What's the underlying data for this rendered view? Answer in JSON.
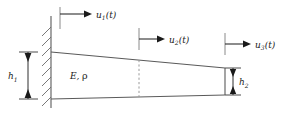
{
  "figure": {
    "type": "engineering-diagram",
    "background_color": "#ffffff",
    "line_color": "#5a5a5a",
    "dark_line_color": "#3c3c3c",
    "text_color": "#1a1a1a",
    "dashed_color": "#9a9a9a"
  },
  "labels": {
    "dof1": {
      "symbol": "u",
      "subscript": "1",
      "argument": "(t)",
      "full": "u1(t)"
    },
    "dof2": {
      "symbol": "u",
      "subscript": "2",
      "argument": "(t)",
      "full": "u2(t)"
    },
    "dof3": {
      "symbol": "u",
      "subscript": "3",
      "argument": "(t)",
      "full": "u3(t)"
    },
    "height_left": {
      "symbol": "h",
      "subscript": "1",
      "full": "h1"
    },
    "height_right": {
      "symbol": "h",
      "subscript": "2",
      "full": "h2"
    },
    "material": {
      "modulus": "E",
      "separator": ",",
      "density": "ρ",
      "full": "E, ρ"
    }
  },
  "elements": {
    "wall": "fixed-support-hatched-wall",
    "beam": "tapered-beam-outline",
    "node_line": "mid-node-dashed-line",
    "arrows": [
      "dof1-arrow",
      "dof2-arrow",
      "dof3-arrow"
    ],
    "dimensions": [
      "h1-dimension",
      "h2-dimension"
    ]
  }
}
